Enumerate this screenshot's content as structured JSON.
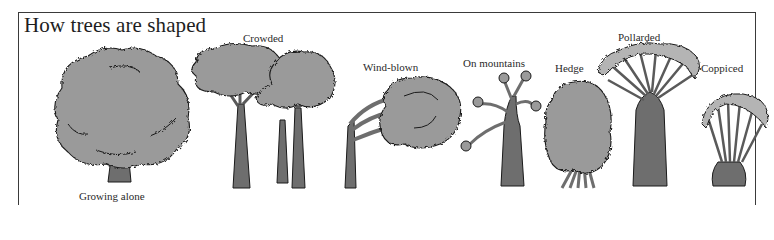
{
  "figure": {
    "title": "How trees are shaped",
    "colors": {
      "foliage": "#9a9a9a",
      "foliage_light": "#b4b4b4",
      "trunk": "#6e6e6e",
      "outline": "#1a1a1a",
      "border": "#3a3a3a",
      "background": "#ffffff"
    },
    "trees": [
      {
        "id": "growing-alone",
        "label": "Growing alone"
      },
      {
        "id": "crowded",
        "label": "Crowded"
      },
      {
        "id": "wind-blown",
        "label": "Wind-blown"
      },
      {
        "id": "on-mountains",
        "label": "On mountains"
      },
      {
        "id": "hedge",
        "label": "Hedge"
      },
      {
        "id": "pollarded",
        "label": "Pollarded"
      },
      {
        "id": "coppiced",
        "label": "Coppiced"
      }
    ]
  }
}
